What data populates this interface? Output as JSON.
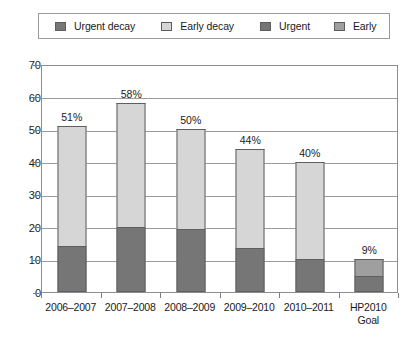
{
  "legend": {
    "items": [
      {
        "label": "Urgent decay",
        "swatch": "#767676",
        "icon": "legend-swatch-icon"
      },
      {
        "label": "Early decay",
        "swatch": "#d6d6d6",
        "icon": "legend-swatch-icon"
      },
      {
        "label": "Urgent",
        "swatch": "#767676",
        "icon": "legend-swatch-icon"
      },
      {
        "label": "Early",
        "swatch": "#9f9f9f",
        "icon": "legend-swatch-icon"
      }
    ]
  },
  "chart_data": {
    "type": "bar",
    "title": "",
    "subtitle": "",
    "xlabel": "",
    "ylabel": "",
    "stacked": true,
    "grid": true,
    "legend_position": "top",
    "ylim": [
      0,
      70
    ],
    "yticks": [
      0,
      10,
      20,
      30,
      40,
      50,
      60,
      70
    ],
    "ytick_labels": [
      "0",
      "10",
      "20",
      "30",
      "40",
      "50",
      "60",
      "70"
    ],
    "categories": [
      "2006–2007",
      "2007–2008",
      "2008–2009",
      "2009–2010",
      "2010–2011",
      "HP2010 Goal"
    ],
    "category_lines": [
      [
        "2006–2007"
      ],
      [
        "2007–2008"
      ],
      [
        "2008–2009"
      ],
      [
        "2009–2010"
      ],
      [
        "2010–2011"
      ],
      [
        "HP2010",
        "Goal"
      ]
    ],
    "series": [
      {
        "name": "Urgent decay",
        "color": "#767676",
        "values": [
          14,
          20,
          19.5,
          13.5,
          10,
          0
        ]
      },
      {
        "name": "Early decay",
        "color": "#d6d6d6",
        "values": [
          37,
          38,
          30.5,
          30.5,
          30,
          0
        ]
      },
      {
        "name": "Urgent",
        "color": "#767676",
        "values": [
          0,
          0,
          0,
          0,
          0,
          5
        ]
      },
      {
        "name": "Early",
        "color": "#9f9f9f",
        "values": [
          0,
          0,
          0,
          0,
          0,
          5
        ]
      }
    ],
    "totals": [
      51,
      58,
      50,
      44,
      40,
      10
    ],
    "data_labels": [
      "51%",
      "58%",
      "50%",
      "44%",
      "40%",
      "9%"
    ],
    "annotations": []
  },
  "colors": {
    "dark_gray": "#767676",
    "mid_gray": "#9f9f9f",
    "light_gray": "#d6d6d6",
    "outline": "#5f5f5f",
    "grid": "#9b9b9b",
    "axis": "#8d8d8d"
  }
}
